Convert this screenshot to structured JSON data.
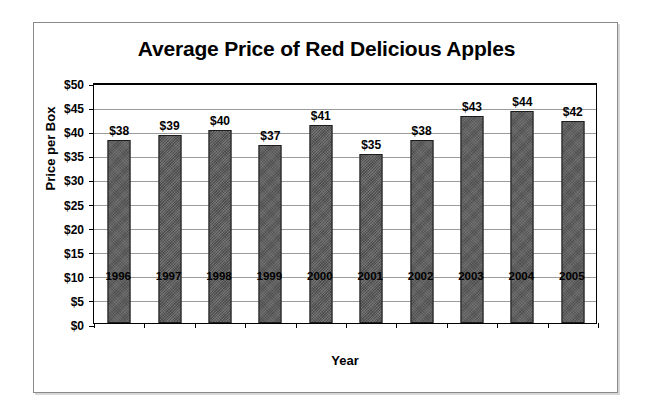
{
  "chart_data": {
    "type": "bar",
    "title": "Average Price of Red Delicious Apples",
    "xlabel": "Year",
    "ylabel": "Price per Box",
    "categories": [
      "1996",
      "1997",
      "1998",
      "1999",
      "2000",
      "2001",
      "2002",
      "2003",
      "2004",
      "2005"
    ],
    "values": [
      38,
      39,
      40,
      37,
      41,
      35,
      38,
      43,
      44,
      42
    ],
    "data_labels": [
      "$38",
      "$39",
      "$40",
      "$37",
      "$41",
      "$35",
      "$38",
      "$43",
      "$44",
      "$42"
    ],
    "ylim": [
      0,
      50
    ],
    "ytick_values": [
      50,
      45,
      40,
      35,
      30,
      25,
      20,
      15,
      10,
      5,
      0
    ],
    "ytick_labels": [
      "$50",
      "$45",
      "$40",
      "$35",
      "$30",
      "$25",
      "$20",
      "$15",
      "$10",
      "$5",
      "$0"
    ],
    "grid": true,
    "legend": "none",
    "bar_color": "#5a5a5a",
    "bar_border_color": "#1c1c1c",
    "gridline_color": "#9b9b9b",
    "axis_color": "#000000",
    "background_color": "#ffffff"
  }
}
